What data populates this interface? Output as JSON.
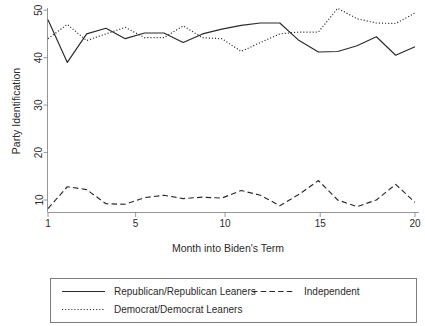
{
  "chart_data": {
    "type": "line",
    "title": "",
    "xlabel": "Month into Biden's Term",
    "ylabel": "Party Identification",
    "xlim": [
      1,
      20
    ],
    "ylim": [
      7,
      51
    ],
    "xticks": [
      1,
      5,
      10,
      15,
      20
    ],
    "yticks": [
      10,
      20,
      30,
      40,
      50
    ],
    "grid": false,
    "legend_position": "below",
    "x": [
      1,
      2,
      3,
      4,
      5,
      6,
      7,
      8,
      9,
      10,
      11,
      12,
      13,
      14,
      15,
      16,
      17,
      18,
      19,
      20
    ],
    "series": [
      {
        "name": "Republican/Republican Leaners",
        "style": "solid",
        "values": [
          48.0,
          39.0,
          45.0,
          46.2,
          44.0,
          45.2,
          45.2,
          43.2,
          45.0,
          46.0,
          46.8,
          47.3,
          47.3,
          43.6,
          41.2,
          41.3,
          42.5,
          44.4,
          40.5,
          42.3
        ]
      },
      {
        "name": "Democrat/Democrat Leaners",
        "style": "dotted",
        "values": [
          44.0,
          47.0,
          43.6,
          45.0,
          46.4,
          44.2,
          44.2,
          46.7,
          44.2,
          44.0,
          41.3,
          43.2,
          45.0,
          45.4,
          45.4,
          50.4,
          48.2,
          47.3,
          47.2,
          49.4
        ]
      },
      {
        "name": "Independent",
        "style": "dashed",
        "values": [
          8.2,
          12.8,
          12.2,
          9.2,
          9.1,
          10.5,
          11.0,
          10.3,
          10.6,
          10.4,
          12.0,
          11.0,
          8.8,
          11.2,
          14.1,
          10.0,
          8.6,
          10.0,
          13.3,
          9.5
        ]
      }
    ]
  },
  "axes": {
    "x_label": "Month into Biden's Term",
    "y_label": "Party Identification",
    "x_tick_labels": [
      "1",
      "5",
      "10",
      "15",
      "20"
    ],
    "y_tick_labels": [
      "10",
      "20",
      "30",
      "40",
      "50"
    ]
  },
  "legend": {
    "entries": [
      {
        "label": "Republican/Republican Leaners",
        "style": "solid"
      },
      {
        "label": "Independent",
        "style": "dashed"
      },
      {
        "label": "Democrat/Democrat Leaners",
        "style": "dotted"
      }
    ]
  },
  "colors": {
    "line": "#2a2a2a",
    "axis": "#8a8a8a",
    "text": "#2b2b2b",
    "background": "#ffffff"
  }
}
